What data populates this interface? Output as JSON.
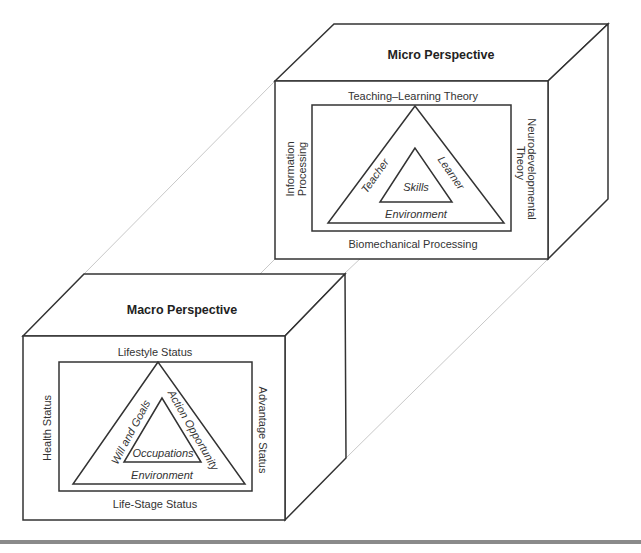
{
  "micro": {
    "title": "Micro Perspective",
    "top": "Teaching–Learning Theory",
    "bottom": "Biomechanical Processing",
    "left_line1": "Information",
    "left_line2": "Processing",
    "right_line1": "Neurodevelopmental",
    "right_line2": "Theory",
    "tri_left": "Teacher",
    "tri_right": "Learner",
    "tri_center": "Skills",
    "tri_base": "Environment"
  },
  "macro": {
    "title": "Macro Perspective",
    "top": "Lifestyle Status",
    "bottom": "Life-Stage Status",
    "left": "Health Status",
    "right": "Advantage Status",
    "tri_left": "Will and Goals",
    "tri_right": "Action Opportunity",
    "tri_center": "Occupations",
    "tri_base": "Environment"
  },
  "colors": {
    "line": "#333333",
    "projector": "#c8c8c8",
    "bar": "#8a8a8a"
  }
}
